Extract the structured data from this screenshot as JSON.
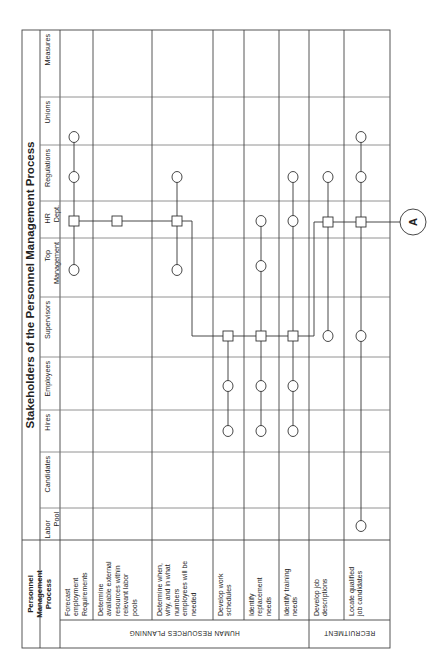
{
  "title": "Stakeholders of the Personnel Management Process",
  "process_header": "Personnel Management Process",
  "process_header_lines": [
    "Personnel",
    "Management",
    "Process"
  ],
  "stakeholders": [
    {
      "id": "measures",
      "lines": [
        "Measures"
      ],
      "y0": 30,
      "y1": 97
    },
    {
      "id": "unions",
      "lines": [
        "Unions"
      ],
      "y0": 97,
      "y1": 145
    },
    {
      "id": "regulations",
      "lines": [
        "Regulations"
      ],
      "y0": 145,
      "y1": 201
    },
    {
      "id": "hr-dept",
      "lines": [
        "HR",
        "Dept."
      ],
      "y0": 201,
      "y1": 238
    },
    {
      "id": "top-management",
      "lines": [
        "Top",
        "Management"
      ],
      "y0": 238,
      "y1": 297
    },
    {
      "id": "supervisors",
      "lines": [
        "Supervisors"
      ],
      "y0": 297,
      "y1": 357
    },
    {
      "id": "employees",
      "lines": [
        "Employees"
      ],
      "y0": 357,
      "y1": 410
    },
    {
      "id": "hires",
      "lines": [
        "Hires"
      ],
      "y0": 410,
      "y1": 452
    },
    {
      "id": "candidates",
      "lines": [
        "Candidates"
      ],
      "y0": 452,
      "y1": 508
    },
    {
      "id": "labor-pool",
      "lines": [
        "Labor",
        "Pool"
      ],
      "y0": 508,
      "y1": 540
    }
  ],
  "processes": [
    {
      "id": "forecast",
      "lines": [
        "Forecast",
        "employment",
        "Requirements"
      ],
      "x0": 60,
      "x1": 93,
      "lane": 74
    },
    {
      "id": "determine-external",
      "lines": [
        "Determine",
        "available external",
        "resources within",
        "relevant labor",
        "pools"
      ],
      "x0": 93,
      "x1": 152,
      "lane": 117
    },
    {
      "id": "determine-when",
      "lines": [
        "Determine when,",
        "why, and in what",
        "numbers",
        "employees will be",
        "needed"
      ],
      "x0": 152,
      "x1": 213,
      "lane": 177
    },
    {
      "id": "work-schedules",
      "lines": [
        "Develop work",
        "schedules"
      ],
      "x0": 213,
      "x1": 244,
      "lane": 228
    },
    {
      "id": "replacement-needs",
      "lines": [
        "Identify",
        "replacement",
        "needs"
      ],
      "x0": 244,
      "x1": 279,
      "lane": 261
    },
    {
      "id": "training-needs",
      "lines": [
        "Identify training",
        "needs"
      ],
      "x0": 279,
      "x1": 309,
      "lane": 293
    },
    {
      "id": "job-descriptions",
      "lines": [
        "Develop job",
        "descriptions"
      ],
      "x0": 309,
      "x1": 344,
      "lane": 328
    },
    {
      "id": "locate-candidates",
      "lines": [
        "Locate qualified",
        "job candidates"
      ],
      "x0": 344,
      "x1": 390,
      "lane": 361
    }
  ],
  "categories": [
    {
      "id": "hr-planning",
      "label": "HUMAN RESOURCES PLANNING",
      "x0": 60,
      "x1": 309
    },
    {
      "id": "recruitment",
      "label": "RECRUITMENT",
      "x0": 309,
      "x1": 390
    }
  ],
  "connector_label": "A",
  "nodes": [
    {
      "process": 0,
      "y": 137,
      "shape": "circle"
    },
    {
      "process": 0,
      "y": 177,
      "shape": "circle"
    },
    {
      "process": 0,
      "y": 221,
      "shape": "square"
    },
    {
      "process": 0,
      "y": 270,
      "shape": "circle"
    },
    {
      "process": 1,
      "y": 221,
      "shape": "square"
    },
    {
      "process": 2,
      "y": 177,
      "shape": "circle"
    },
    {
      "process": 2,
      "y": 221,
      "shape": "square"
    },
    {
      "process": 2,
      "y": 270,
      "shape": "circle"
    },
    {
      "process": 3,
      "y": 336,
      "shape": "square"
    },
    {
      "process": 3,
      "y": 386,
      "shape": "circle"
    },
    {
      "process": 3,
      "y": 431,
      "shape": "circle"
    },
    {
      "process": 4,
      "y": 221,
      "shape": "circle"
    },
    {
      "process": 4,
      "y": 266,
      "shape": "circle"
    },
    {
      "process": 4,
      "y": 336,
      "shape": "square"
    },
    {
      "process": 4,
      "y": 386,
      "shape": "circle"
    },
    {
      "process": 4,
      "y": 431,
      "shape": "circle"
    },
    {
      "process": 5,
      "y": 177,
      "shape": "circle"
    },
    {
      "process": 5,
      "y": 221,
      "shape": "circle"
    },
    {
      "process": 5,
      "y": 336,
      "shape": "square"
    },
    {
      "process": 5,
      "y": 386,
      "shape": "circle"
    },
    {
      "process": 5,
      "y": 431,
      "shape": "circle"
    },
    {
      "process": 6,
      "y": 177,
      "shape": "circle"
    },
    {
      "process": 6,
      "y": 222,
      "shape": "square"
    },
    {
      "process": 6,
      "y": 336,
      "shape": "circle"
    },
    {
      "process": 7,
      "y": 137,
      "shape": "circle"
    },
    {
      "process": 7,
      "y": 177,
      "shape": "circle"
    },
    {
      "process": 7,
      "y": 222,
      "shape": "square"
    },
    {
      "process": 7,
      "y": 336,
      "shape": "circle"
    },
    {
      "process": 7,
      "y": 526,
      "shape": "circle"
    }
  ],
  "vertical_links": [
    {
      "process": 0,
      "y0": 137,
      "y1": 270
    },
    {
      "process": 2,
      "y0": 177,
      "y1": 270
    },
    {
      "process": 3,
      "y0": 336,
      "y1": 431
    },
    {
      "process": 4,
      "y0": 221,
      "y1": 431
    },
    {
      "process": 5,
      "y0": 177,
      "y1": 431
    },
    {
      "process": 6,
      "y0": 177,
      "y1": 336
    },
    {
      "process": 7,
      "y0": 137,
      "y1": 526
    }
  ],
  "horizontal_links": [
    {
      "y": 221,
      "x0": 74,
      "x1": 177
    },
    {
      "y": 222,
      "x0": 328,
      "x1": 404
    },
    {
      "y": 336,
      "x0": 228,
      "x1": 293
    }
  ],
  "elbow_links": [
    {
      "points": [
        [
          177,
          221
        ],
        [
          192,
          221
        ],
        [
          192,
          336
        ],
        [
          228,
          336
        ]
      ]
    },
    {
      "points": [
        [
          328,
          222
        ],
        [
          314,
          222
        ],
        [
          314,
          336
        ],
        [
          293,
          336
        ]
      ]
    }
  ],
  "connector": {
    "x": 413,
    "y": 222,
    "r": 13
  }
}
